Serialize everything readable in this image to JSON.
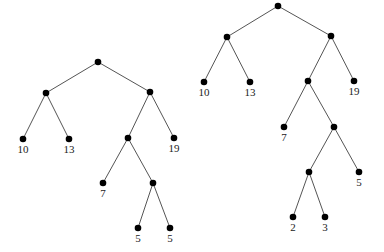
{
  "diagram": {
    "type": "binary-trees",
    "trees": [
      {
        "name": "tree-left",
        "nodes": [
          {
            "id": "a",
            "x": 98,
            "y": 62,
            "label": ""
          },
          {
            "id": "b",
            "x": 46,
            "y": 93,
            "label": ""
          },
          {
            "id": "c",
            "x": 150,
            "y": 92,
            "label": ""
          },
          {
            "id": "d",
            "x": 23,
            "y": 139,
            "label": "10"
          },
          {
            "id": "e",
            "x": 69,
            "y": 139,
            "label": "13"
          },
          {
            "id": "f",
            "x": 128,
            "y": 138,
            "label": ""
          },
          {
            "id": "g",
            "x": 174,
            "y": 138,
            "label": "19"
          },
          {
            "id": "h",
            "x": 103,
            "y": 183,
            "label": "7"
          },
          {
            "id": "i",
            "x": 153,
            "y": 183,
            "label": ""
          },
          {
            "id": "j",
            "x": 138,
            "y": 228,
            "label": "5"
          },
          {
            "id": "k",
            "x": 170,
            "y": 228,
            "label": "5"
          }
        ],
        "edges": [
          [
            "a",
            "b"
          ],
          [
            "a",
            "c"
          ],
          [
            "b",
            "d"
          ],
          [
            "b",
            "e"
          ],
          [
            "c",
            "f"
          ],
          [
            "c",
            "g"
          ],
          [
            "f",
            "h"
          ],
          [
            "f",
            "i"
          ],
          [
            "i",
            "j"
          ],
          [
            "i",
            "k"
          ]
        ]
      },
      {
        "name": "tree-right",
        "nodes": [
          {
            "id": "a",
            "x": 278,
            "y": 6,
            "label": ""
          },
          {
            "id": "b",
            "x": 227,
            "y": 37,
            "label": ""
          },
          {
            "id": "c",
            "x": 331,
            "y": 36,
            "label": ""
          },
          {
            "id": "d",
            "x": 204,
            "y": 82,
            "label": "10"
          },
          {
            "id": "e",
            "x": 250,
            "y": 82,
            "label": "13"
          },
          {
            "id": "f",
            "x": 308,
            "y": 81,
            "label": ""
          },
          {
            "id": "g",
            "x": 354,
            "y": 81,
            "label": "19"
          },
          {
            "id": "h",
            "x": 284,
            "y": 127,
            "label": "7"
          },
          {
            "id": "i",
            "x": 334,
            "y": 127,
            "label": ""
          },
          {
            "id": "j",
            "x": 309,
            "y": 172,
            "label": ""
          },
          {
            "id": "k",
            "x": 359,
            "y": 172,
            "label": "5"
          },
          {
            "id": "l",
            "x": 293,
            "y": 217,
            "label": "2"
          },
          {
            "id": "m",
            "x": 325,
            "y": 217,
            "label": "3"
          }
        ],
        "edges": [
          [
            "a",
            "b"
          ],
          [
            "a",
            "c"
          ],
          [
            "b",
            "d"
          ],
          [
            "b",
            "e"
          ],
          [
            "c",
            "f"
          ],
          [
            "c",
            "g"
          ],
          [
            "f",
            "h"
          ],
          [
            "f",
            "i"
          ],
          [
            "i",
            "j"
          ],
          [
            "i",
            "k"
          ],
          [
            "j",
            "l"
          ],
          [
            "j",
            "m"
          ]
        ]
      }
    ]
  }
}
